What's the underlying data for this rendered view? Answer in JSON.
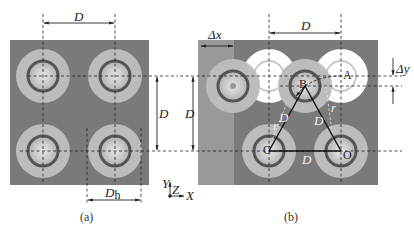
{
  "figure": {
    "panel_a": {
      "caption": "(a)",
      "labels": {
        "top_spacing": "D",
        "right_spacing": "D",
        "hole_diameter": "D",
        "hole_diameter_sub": "h"
      },
      "axes": {
        "y": "Y",
        "z": "Z",
        "x": "X"
      }
    },
    "panel_b": {
      "caption": "(b)",
      "labels": {
        "left_spacing": "D",
        "top_spacing": "D",
        "offset_x": "Δx",
        "offset_y": "Δy",
        "point_a": "A",
        "point_b": "B",
        "point_c": "C",
        "point_o": "O",
        "side_bc": "D",
        "side_bo": "D",
        "side_co": "D",
        "radius_left": "r",
        "radius_right": "r"
      }
    },
    "colors": {
      "plate": "#7a7a7a",
      "plate_light": "#9a9a9a",
      "ring_outer": "#bdbdbd",
      "ring_dark": "#555555",
      "center": "#d8d8d8",
      "ghost": "#ffffff"
    }
  }
}
